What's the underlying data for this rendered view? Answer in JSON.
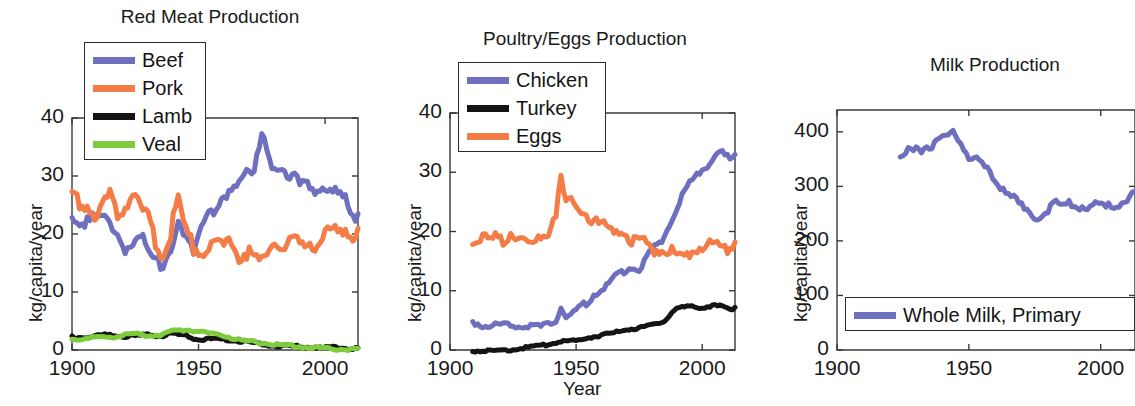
{
  "figure": {
    "background": "#ffffff",
    "xlabel": "Year",
    "ylabel": "kg/capita/year"
  },
  "colors": {
    "blue": "#6f6fc0",
    "orange": "#f47c46",
    "black": "#141414",
    "green": "#7ecb3e",
    "axis": "#3a3a3a",
    "text": "#1a1a1a"
  },
  "chart_data": [
    {
      "type": "line",
      "title": "Red Meat Production",
      "xlabel": "",
      "ylabel": "kg/capita/year",
      "xlim": [
        1900,
        2013
      ],
      "ylim": [
        0,
        40
      ],
      "xticks": [
        1900,
        1950,
        2000
      ],
      "yticks": [
        0,
        10,
        20,
        30,
        40
      ],
      "grid": false,
      "legend_position": "top-left",
      "series": [
        {
          "name": "Beef",
          "color": "#6f6fc0",
          "x": [
            1900,
            1903,
            1906,
            1909,
            1912,
            1915,
            1918,
            1921,
            1924,
            1927,
            1930,
            1933,
            1936,
            1939,
            1942,
            1945,
            1948,
            1951,
            1954,
            1957,
            1960,
            1963,
            1966,
            1969,
            1972,
            1975,
            1978,
            1981,
            1984,
            1987,
            1990,
            1993,
            1996,
            1999,
            2002,
            2005,
            2008,
            2011,
            2013
          ],
          "y": [
            22.5,
            21.0,
            23.6,
            24.5,
            23.8,
            21.5,
            20.0,
            18.0,
            19.5,
            20.5,
            17.5,
            16.0,
            15.0,
            18.5,
            22.0,
            19.5,
            17.0,
            22.5,
            25.0,
            24.5,
            26.0,
            28.0,
            30.5,
            32.5,
            31.0,
            37.5,
            33.0,
            32.5,
            31.5,
            30.5,
            29.0,
            29.5,
            28.0,
            29.0,
            27.5,
            27.5,
            26.5,
            24.0,
            23.5
          ]
        },
        {
          "name": "Pork",
          "color": "#f47c46",
          "x": [
            1900,
            1903,
            1906,
            1909,
            1912,
            1915,
            1918,
            1921,
            1924,
            1927,
            1930,
            1933,
            1936,
            1939,
            1942,
            1945,
            1948,
            1951,
            1954,
            1957,
            1960,
            1963,
            1966,
            1969,
            1972,
            1975,
            1978,
            1981,
            1984,
            1987,
            1990,
            1993,
            1996,
            1999,
            2002,
            2005,
            2008,
            2011,
            2013
          ],
          "y": [
            27.5,
            25.5,
            26.0,
            24.5,
            25.5,
            27.0,
            24.0,
            25.5,
            28.5,
            25.0,
            24.5,
            19.0,
            17.5,
            21.0,
            27.0,
            21.0,
            18.5,
            18.0,
            18.0,
            18.5,
            18.0,
            19.0,
            17.0,
            17.5,
            17.0,
            15.5,
            18.5,
            20.0,
            18.5,
            19.0,
            19.0,
            20.0,
            19.0,
            20.5,
            20.5,
            21.0,
            22.0,
            21.0,
            21.0
          ]
        },
        {
          "name": "Lamb",
          "color": "#141414",
          "x": [
            1900,
            1905,
            1910,
            1915,
            1920,
            1925,
            1930,
            1935,
            1940,
            1945,
            1950,
            1955,
            1960,
            1965,
            1970,
            1975,
            1980,
            1985,
            1990,
            1995,
            2000,
            2005,
            2010,
            2013
          ],
          "y": [
            2.4,
            2.3,
            2.6,
            2.7,
            2.5,
            2.6,
            2.8,
            2.6,
            2.9,
            2.6,
            1.9,
            2.0,
            2.0,
            1.7,
            1.5,
            1.1,
            0.9,
            0.8,
            0.7,
            0.6,
            0.5,
            0.5,
            0.4,
            0.4
          ]
        },
        {
          "name": "Veal",
          "color": "#7ecb3e",
          "x": [
            1900,
            1905,
            1910,
            1915,
            1920,
            1925,
            1930,
            1935,
            1940,
            1945,
            1950,
            1955,
            1960,
            1965,
            1970,
            1975,
            1980,
            1985,
            1990,
            1995,
            2000,
            2005,
            2010,
            2013
          ],
          "y": [
            2.0,
            2.1,
            2.3,
            2.4,
            2.6,
            2.9,
            2.6,
            2.8,
            3.4,
            3.6,
            3.4,
            3.0,
            2.6,
            2.0,
            1.6,
            1.4,
            1.1,
            0.9,
            0.7,
            0.5,
            0.4,
            0.3,
            0.3,
            0.3
          ]
        }
      ]
    },
    {
      "type": "line",
      "title": "Poultry/Eggs Production",
      "xlabel": "Year",
      "ylabel": "kg/capita/year",
      "xlim": [
        1900,
        2013
      ],
      "ylim": [
        0,
        40
      ],
      "xticks": [
        1900,
        1950,
        2000
      ],
      "yticks": [
        0,
        10,
        20,
        30,
        40
      ],
      "grid": false,
      "legend_position": "top-left",
      "series": [
        {
          "name": "Chicken",
          "color": "#6f6fc0",
          "x": [
            1909,
            1912,
            1915,
            1918,
            1921,
            1924,
            1927,
            1930,
            1933,
            1936,
            1939,
            1942,
            1944,
            1946,
            1948,
            1951,
            1954,
            1957,
            1960,
            1963,
            1966,
            1969,
            1972,
            1975,
            1978,
            1981,
            1984,
            1987,
            1990,
            1993,
            1996,
            1999,
            2002,
            2005,
            2008,
            2011,
            2013
          ],
          "y": [
            5.0,
            4.6,
            4.5,
            4.4,
            4.3,
            4.3,
            4.4,
            4.4,
            4.2,
            4.2,
            4.5,
            5.2,
            7.4,
            5.8,
            6.0,
            7.3,
            8.2,
            9.8,
            10.6,
            11.5,
            13.0,
            13.5,
            14.5,
            14.0,
            16.0,
            17.5,
            19.0,
            21.5,
            24.5,
            27.0,
            29.0,
            30.5,
            31.5,
            33.0,
            33.5,
            32.5,
            33.0
          ]
        },
        {
          "name": "Turkey",
          "color": "#141414",
          "x": [
            1909,
            1915,
            1920,
            1925,
            1929,
            1933,
            1937,
            1940,
            1945,
            1950,
            1955,
            1960,
            1965,
            1970,
            1975,
            1980,
            1985,
            1988,
            1990,
            1993,
            1996,
            1999,
            2002,
            2005,
            2008,
            2011,
            2013
          ],
          "y": [
            0.0,
            0.0,
            0.1,
            0.2,
            0.5,
            0.6,
            0.9,
            1.2,
            1.6,
            1.7,
            2.2,
            2.6,
            3.0,
            3.6,
            3.8,
            4.3,
            5.0,
            6.5,
            7.2,
            7.3,
            7.5,
            7.2,
            7.5,
            7.6,
            7.5,
            7.0,
            7.2
          ]
        },
        {
          "name": "Eggs",
          "color": "#f47c46",
          "x": [
            1909,
            1912,
            1915,
            1918,
            1921,
            1924,
            1927,
            1930,
            1933,
            1936,
            1939,
            1942,
            1944,
            1946,
            1948,
            1951,
            1954,
            1957,
            1960,
            1963,
            1966,
            1969,
            1972,
            1975,
            1978,
            1981,
            1984,
            1987,
            1990,
            1993,
            1996,
            1999,
            2002,
            2005,
            2008,
            2011,
            2013
          ],
          "y": [
            18.5,
            19.5,
            19.0,
            19.5,
            19.0,
            20.5,
            20.0,
            18.5,
            18.0,
            19.5,
            20.5,
            24.0,
            29.0,
            25.5,
            25.5,
            25.0,
            23.5,
            22.5,
            21.5,
            21.0,
            21.5,
            20.5,
            19.0,
            18.5,
            18.5,
            17.5,
            17.5,
            17.5,
            16.5,
            16.5,
            17.5,
            18.0,
            18.2,
            18.5,
            18.0,
            17.8,
            18.2
          ]
        }
      ]
    },
    {
      "type": "line",
      "title": "Milk Production",
      "xlabel": "",
      "ylabel": "kg/capita/year",
      "xlim": [
        1900,
        2013
      ],
      "ylim": [
        0,
        440
      ],
      "xticks": [
        1900,
        1950,
        2000
      ],
      "yticks": [
        0,
        100,
        200,
        300,
        400
      ],
      "grid": false,
      "legend_position": "bottom",
      "series": [
        {
          "name": "Whole Milk, Primary",
          "color": "#6f6fc0",
          "x": [
            1924,
            1927,
            1930,
            1932,
            1934,
            1936,
            1938,
            1940,
            1942,
            1944,
            1946,
            1948,
            1950,
            1953,
            1956,
            1959,
            1962,
            1965,
            1968,
            1971,
            1974,
            1977,
            1980,
            1983,
            1986,
            1989,
            1992,
            1995,
            1998,
            2001,
            2004,
            2007,
            2010,
            2013
          ],
          "y": [
            355,
            368,
            377,
            372,
            380,
            375,
            383,
            392,
            390,
            410,
            395,
            372,
            360,
            352,
            340,
            320,
            305,
            295,
            278,
            262,
            250,
            248,
            262,
            272,
            270,
            272,
            268,
            266,
            268,
            265,
            266,
            272,
            282,
            290
          ]
        }
      ]
    }
  ]
}
